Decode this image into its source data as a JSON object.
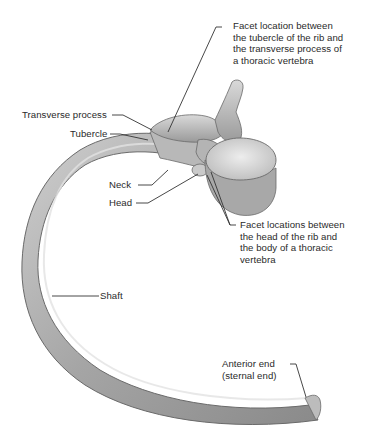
{
  "figure": {
    "labels": {
      "facet_tubercle": "Facet location between\nthe tubercle of the rib and\nthe transverse process of\na thoracic vertebra",
      "transverse_process": "Transverse process",
      "tubercle": "Tubercle",
      "neck": "Neck",
      "head": "Head",
      "facet_head": "Facet locations between\nthe head of the rib and\nthe body of a thoracic\nvertebra",
      "shaft": "Shaft",
      "anterior_end": "Anterior end\n(sternal end)"
    },
    "colors": {
      "background": "#ffffff",
      "bone_mid": "#a9a9a9",
      "bone_light": "#d6d6d6",
      "bone_dark": "#6e6e6e",
      "leader_line": "#333333",
      "text": "#2a2a2a"
    }
  }
}
